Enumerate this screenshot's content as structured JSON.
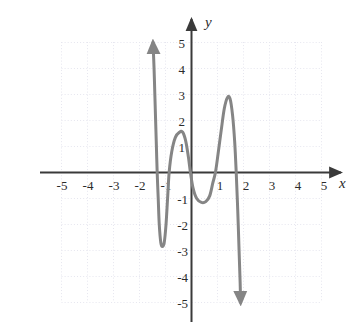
{
  "figure": {
    "background_color": "#ffffff",
    "axis_color": "#3a3a3a",
    "curve_color": "#858585",
    "grid_color": "#e6e6ef",
    "tick_label_color": "#2b2b2b",
    "x_axis_name": "x",
    "y_axis_name": "y"
  },
  "chart_data": {
    "type": "line",
    "title": "",
    "subtitle": "",
    "xlabel": "x",
    "ylabel": "y",
    "xlim": [
      -5.6,
      5.6
    ],
    "ylim": [
      -5.6,
      5.6
    ],
    "grid": true,
    "grid_style": "dotted",
    "legend": "none",
    "axis_arrows": [
      "x-positive",
      "y-positive"
    ],
    "x_ticks": [
      -5,
      -4,
      -3,
      -2,
      -1,
      1,
      2,
      3,
      4,
      5
    ],
    "x_tick_labels": [
      "-5",
      "-4",
      "-3",
      "-2",
      "-1",
      "1",
      "2",
      "3",
      "4",
      "5"
    ],
    "y_ticks": [
      5,
      4,
      3,
      2,
      1,
      -1,
      -2,
      -3,
      -4,
      -5
    ],
    "y_tick_labels": [
      "5",
      "4",
      "3",
      "2",
      "1",
      "-1",
      "-2",
      "-3",
      "-4",
      "-5"
    ],
    "series": [
      {
        "name": "polynomial curve",
        "style": "solid",
        "width": 3,
        "arrow_start": "up",
        "arrow_end": "down",
        "points": [
          [
            -1.48,
            5.0
          ],
          [
            -1.44,
            4.0
          ],
          [
            -1.41,
            3.0
          ],
          [
            -1.38,
            2.0
          ],
          [
            -1.35,
            1.0
          ],
          [
            -1.32,
            0.0
          ],
          [
            -1.28,
            -1.0
          ],
          [
            -1.24,
            -2.0
          ],
          [
            -1.18,
            -2.7
          ],
          [
            -1.12,
            -2.85
          ],
          [
            -1.05,
            -2.7
          ],
          [
            -0.98,
            -2.0
          ],
          [
            -0.92,
            -1.0
          ],
          [
            -0.86,
            0.0
          ],
          [
            -0.76,
            0.8
          ],
          [
            -0.62,
            1.35
          ],
          [
            -0.46,
            1.55
          ],
          [
            -0.34,
            1.55
          ],
          [
            -0.22,
            1.2
          ],
          [
            -0.12,
            0.6
          ],
          [
            -0.04,
            0.0
          ],
          [
            0.06,
            -0.6
          ],
          [
            0.2,
            -1.0
          ],
          [
            0.38,
            -1.15
          ],
          [
            0.55,
            -1.12
          ],
          [
            0.7,
            -0.9
          ],
          [
            0.82,
            -0.4
          ],
          [
            0.92,
            0.0
          ],
          [
            1.02,
            0.7
          ],
          [
            1.14,
            1.6
          ],
          [
            1.26,
            2.45
          ],
          [
            1.38,
            2.88
          ],
          [
            1.48,
            2.85
          ],
          [
            1.58,
            2.2
          ],
          [
            1.66,
            1.2
          ],
          [
            1.72,
            0.0
          ],
          [
            1.78,
            -1.5
          ],
          [
            1.83,
            -3.0
          ],
          [
            1.87,
            -4.2
          ],
          [
            1.89,
            -5.0
          ]
        ],
        "features": {
          "local_minimum_left": [
            -1.12,
            -2.85
          ],
          "local_maximum_left": [
            -0.4,
            1.55
          ],
          "local_minimum_right": [
            0.45,
            -1.15
          ],
          "local_maximum_right": [
            1.4,
            2.9
          ],
          "x_intercepts": [
            -1.32,
            -0.86,
            -0.04,
            0.92,
            1.72
          ],
          "end_behavior_left": "rises to +infinity",
          "end_behavior_right": "falls to -infinity"
        }
      }
    ]
  }
}
